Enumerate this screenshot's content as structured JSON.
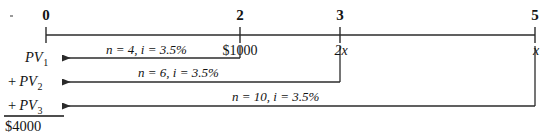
{
  "diagram": {
    "type": "cash-flow-timeline",
    "title": "",
    "axis": {
      "y": 35,
      "x_start": 46,
      "x_end": 535,
      "stroke": "#2b2b2b",
      "ticks": [
        {
          "label": "0",
          "period": 0,
          "x": 46
        },
        {
          "label": "2",
          "period": 2,
          "x": 240
        },
        {
          "label": "3",
          "period": 3,
          "x": 340
        },
        {
          "label": "5",
          "period": 5,
          "x": 535
        }
      ]
    },
    "cash_flows": [
      {
        "label": "$1000",
        "period": 2,
        "x": 240,
        "italic": false
      },
      {
        "label": "2x",
        "period": 3,
        "x": 340,
        "italic": true
      },
      {
        "label": "x",
        "period": 5,
        "x": 535,
        "italic": true
      }
    ],
    "discount_arrows": [
      {
        "target": "PV1",
        "from_x": 240,
        "to_x": 62,
        "y": 58,
        "rate_label": "n = 4, i = 3.5%",
        "n": 4,
        "i": "3.5%",
        "rate_label_x": 106,
        "rate_label_y": 43
      },
      {
        "target": "PV2",
        "from_x": 340,
        "to_x": 62,
        "y": 82,
        "rate_label": "n = 6, i = 3.5%",
        "n": 6,
        "i": "3.5%",
        "rate_label_x": 138,
        "rate_label_y": 66
      },
      {
        "target": "PV3",
        "from_x": 535,
        "to_x": 62,
        "y": 106,
        "rate_label": "n = 10, i = 3.5%",
        "n": 10,
        "i": "3.5%",
        "rate_label_x": 232,
        "rate_label_y": 89
      }
    ],
    "present_values": [
      {
        "plus": "",
        "name": "PV",
        "subscript": "1",
        "y": 50
      },
      {
        "plus": "+",
        "name": "PV",
        "subscript": "2",
        "y": 74
      },
      {
        "plus": "+",
        "name": "PV",
        "subscript": "3",
        "y": 98
      }
    ],
    "sum": {
      "label": "$4000",
      "rule_x": 4,
      "rule_width": 60,
      "rule_y": 116,
      "y": 119
    },
    "colors": {
      "ink": "#131313",
      "line": "#2b2b2b"
    }
  }
}
